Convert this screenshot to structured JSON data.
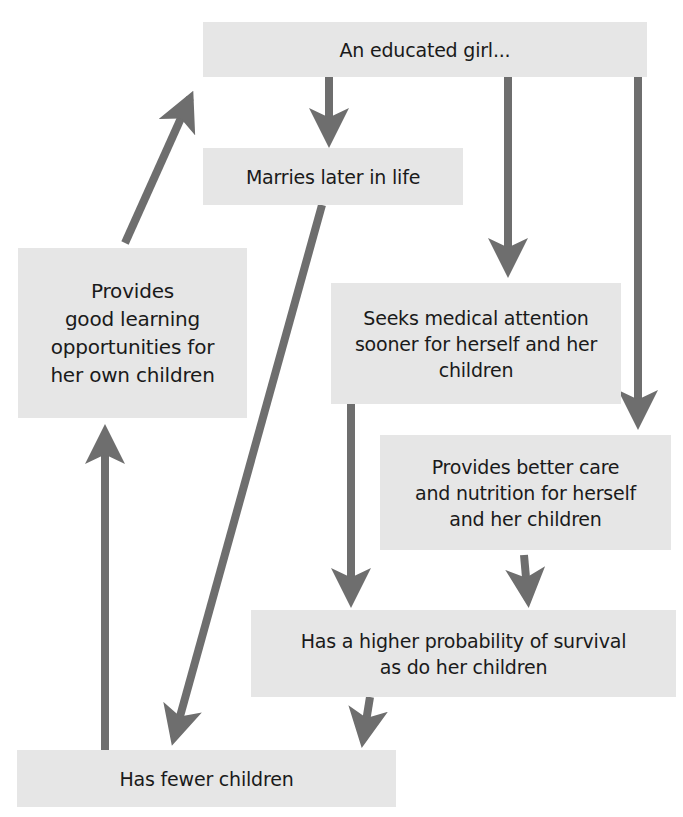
{
  "diagram": {
    "type": "flowchart",
    "colors": {
      "box_fill": "#e6e6e6",
      "arrow": "#6e6e6e",
      "text": "#1a1a1a",
      "background": "#ffffff"
    },
    "nodes": [
      {
        "id": "educated_girl",
        "label": "An educated girl..."
      },
      {
        "id": "marries_later",
        "label": "Marries later in life"
      },
      {
        "id": "learning",
        "label": "Provides\ngood learning\nopportunities for\nher own children"
      },
      {
        "id": "medical",
        "label": "Seeks medical attention\nsooner for herself and her\nchildren"
      },
      {
        "id": "care",
        "label": "Provides better care\nand nutrition for herself\nand her children"
      },
      {
        "id": "survival",
        "label": "Has a higher probability of survival\nas do her children"
      },
      {
        "id": "fewer",
        "label": "Has fewer children"
      }
    ],
    "edges": [
      {
        "from": "educated_girl",
        "to": "marries_later"
      },
      {
        "from": "educated_girl",
        "to": "medical"
      },
      {
        "from": "educated_girl",
        "to": "care"
      },
      {
        "from": "marries_later",
        "to": "fewer"
      },
      {
        "from": "medical",
        "to": "survival"
      },
      {
        "from": "care",
        "to": "survival"
      },
      {
        "from": "survival",
        "to": "fewer"
      },
      {
        "from": "fewer",
        "to": "learning"
      },
      {
        "from": "learning",
        "to": "educated_girl"
      }
    ]
  }
}
